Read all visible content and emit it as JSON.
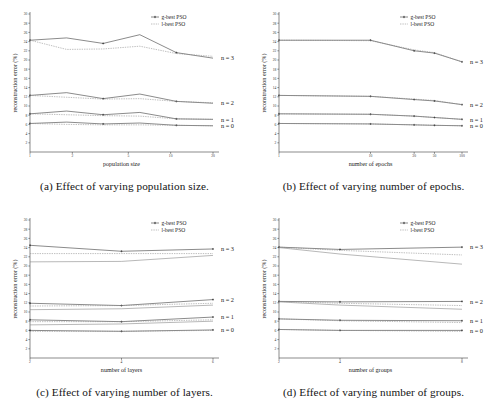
{
  "figure": {
    "background": "#ffffff",
    "series_colors": {
      "g_best": "#2b2b2b",
      "l_best": "#8a8a8a"
    }
  },
  "legend": {
    "g_best_label": "g-best PSO",
    "l_best_label": "l-best PSO"
  },
  "series_labels": {
    "n3": "n = 3",
    "n2": "n = 2",
    "n1": "n = 1",
    "n0": "n = 0"
  },
  "captions": {
    "a": "(a) Effect of varying population size.",
    "b": "(b) Effect of varying number of epochs.",
    "c": "(c) Effect of varying number of layers.",
    "d": "(d) Effect of varying number of groups."
  },
  "axis": {
    "ylabel": "reconstruction error (%)",
    "yticks": [
      "2",
      "4",
      "6",
      "8",
      "10",
      "12",
      "14",
      "16",
      "18",
      "20",
      "22",
      "24",
      "26",
      "28",
      "30"
    ]
  },
  "chart_data": [
    {
      "id": "a",
      "type": "line",
      "title": "(a) Effect of varying population size.",
      "xlabel": "population size",
      "ylabel": "reconstruction error (%)",
      "xscale": "log",
      "xticks": [
        "1",
        "2",
        "5",
        "10",
        "20"
      ],
      "x": [
        1,
        2,
        5,
        10,
        20
      ],
      "ylim": [
        0,
        30
      ],
      "xlim": [
        1,
        20
      ],
      "grid": false,
      "legend_position": "top-right",
      "series": [
        {
          "name": "g-best PSO n = 3",
          "style": "solid",
          "color": "#2b2b2b",
          "values": [
            24.3,
            24.8,
            23.6,
            25.5,
            21.6,
            20.4
          ]
        },
        {
          "name": "l-best PSO n = 3",
          "style": "dashed",
          "color": "#8a8a8a",
          "values": [
            24.3,
            22.3,
            22.4,
            23.0,
            21.4,
            20.8
          ]
        },
        {
          "name": "g-best PSO n = 2",
          "style": "solid",
          "color": "#2b2b2b",
          "values": [
            12.3,
            12.9,
            11.6,
            12.6,
            11.0,
            10.6
          ]
        },
        {
          "name": "l-best PSO n = 2",
          "style": "dashed",
          "color": "#8a8a8a",
          "values": [
            12.3,
            11.9,
            11.5,
            11.6,
            11.0,
            10.7
          ]
        },
        {
          "name": "g-best PSO n = 1",
          "style": "solid",
          "color": "#2b2b2b",
          "values": [
            8.3,
            8.9,
            8.1,
            8.6,
            7.2,
            7.1
          ]
        },
        {
          "name": "l-best PSO n = 1",
          "style": "dashed",
          "color": "#8a8a8a",
          "values": [
            8.3,
            8.1,
            7.9,
            7.8,
            7.2,
            7.1
          ]
        },
        {
          "name": "g-best PSO n = 0",
          "style": "solid",
          "color": "#2b2b2b",
          "values": [
            6.2,
            6.5,
            6.1,
            6.3,
            5.8,
            5.7
          ]
        },
        {
          "name": "l-best PSO n = 0",
          "style": "dashed",
          "color": "#8a8a8a",
          "values": [
            6.2,
            6.0,
            5.9,
            5.9,
            5.8,
            5.7
          ]
        }
      ]
    },
    {
      "id": "b",
      "type": "line",
      "title": "(b) Effect of varying number of epochs.",
      "xlabel": "number of epochs",
      "ylabel": "reconstruction error (%)",
      "xscale": "log",
      "xticks": [
        "1",
        "10",
        "30",
        "50",
        "100"
      ],
      "x": [
        1,
        10,
        30,
        50,
        100
      ],
      "ylim": [
        0,
        30
      ],
      "xlim": [
        1,
        100
      ],
      "grid": false,
      "legend_position": "top-right",
      "series": [
        {
          "name": "g-best PSO n = 3",
          "style": "solid",
          "color": "#2b2b2b",
          "values": [
            24.3,
            24.3,
            22.0,
            21.5,
            19.6
          ]
        },
        {
          "name": "l-best PSO n = 3",
          "style": "dashed",
          "color": "#8a8a8a",
          "values": [
            24.3,
            24.2,
            22.2,
            21.6,
            19.6
          ]
        },
        {
          "name": "g-best PSO n = 2",
          "style": "solid",
          "color": "#2b2b2b",
          "values": [
            12.3,
            12.1,
            11.4,
            11.1,
            10.3
          ]
        },
        {
          "name": "l-best PSO n = 2",
          "style": "dashed",
          "color": "#8a8a8a",
          "values": [
            12.3,
            12.1,
            11.5,
            11.2,
            10.3
          ]
        },
        {
          "name": "g-best PSO n = 1",
          "style": "solid",
          "color": "#2b2b2b",
          "values": [
            8.3,
            8.2,
            7.8,
            7.5,
            7.1
          ]
        },
        {
          "name": "l-best PSO n = 1",
          "style": "dashed",
          "color": "#8a8a8a",
          "values": [
            8.3,
            8.2,
            7.8,
            7.5,
            7.1
          ]
        },
        {
          "name": "g-best PSO n = 0",
          "style": "solid",
          "color": "#2b2b2b",
          "values": [
            6.2,
            6.1,
            5.9,
            5.8,
            5.7
          ]
        },
        {
          "name": "l-best PSO n = 0",
          "style": "dashed",
          "color": "#8a8a8a",
          "values": [
            6.2,
            6.1,
            5.9,
            5.8,
            5.7
          ]
        }
      ]
    },
    {
      "id": "c",
      "type": "line",
      "title": "(c) Effect of varying number of layers.",
      "xlabel": "number of layers",
      "ylabel": "reconstruction error (%)",
      "xscale": "linear",
      "xticks": [
        "2",
        "4",
        "6"
      ],
      "x": [
        2,
        4,
        6
      ],
      "ylim": [
        0,
        30
      ],
      "xlim": [
        2,
        6
      ],
      "grid": false,
      "legend_position": "top-right",
      "series": [
        {
          "name": "g-best PSO n = 3",
          "style": "solid",
          "color": "#2b2b2b",
          "values": [
            24.5,
            23.2,
            23.7
          ]
        },
        {
          "name": "l-best PSO n = 3",
          "style": "dashed",
          "color": "#8a8a8a",
          "values": [
            22.7,
            22.7,
            22.7
          ]
        },
        {
          "name": "l-best PSO n = 3 alt",
          "style": "solid",
          "color": "#9a9a9a",
          "values": [
            20.9,
            21.0,
            22.3
          ]
        },
        {
          "name": "g-best PSO n = 2",
          "style": "solid",
          "color": "#2b2b2b",
          "values": [
            11.9,
            11.4,
            12.7
          ]
        },
        {
          "name": "l-best PSO n = 2",
          "style": "dashed",
          "color": "#8a8a8a",
          "values": [
            11.3,
            11.4,
            11.9
          ]
        },
        {
          "name": "l-best PSO n = 2 alt",
          "style": "solid",
          "color": "#9a9a9a",
          "values": [
            10.5,
            10.7,
            11.5
          ]
        },
        {
          "name": "g-best PSO n = 1",
          "style": "solid",
          "color": "#2b2b2b",
          "values": [
            8.3,
            7.9,
            8.9
          ]
        },
        {
          "name": "l-best PSO n = 1",
          "style": "dashed",
          "color": "#8a8a8a",
          "values": [
            7.9,
            7.9,
            8.3
          ]
        },
        {
          "name": "l-best PSO n = 1 alt",
          "style": "solid",
          "color": "#9a9a9a",
          "values": [
            7.2,
            7.4,
            8.0
          ]
        },
        {
          "name": "g-best PSO n = 0",
          "style": "solid",
          "color": "#2b2b2b",
          "values": [
            6.0,
            5.8,
            6.1
          ]
        },
        {
          "name": "l-best PSO n = 0",
          "style": "dashed",
          "color": "#8a8a8a",
          "values": [
            5.8,
            5.8,
            6.0
          ]
        }
      ]
    },
    {
      "id": "d",
      "type": "line",
      "title": "(d) Effect of varying number of groups.",
      "xlabel": "number of groups",
      "ylabel": "reconstruction error (%)",
      "xscale": "linear",
      "xticks": [
        "2",
        "4",
        "8"
      ],
      "x": [
        2,
        4,
        8
      ],
      "ylim": [
        0,
        30
      ],
      "xlim": [
        2,
        8
      ],
      "grid": false,
      "legend_position": "top-right",
      "series": [
        {
          "name": "g-best PSO n = 3",
          "style": "solid",
          "color": "#2b2b2b",
          "values": [
            24.1,
            23.6,
            24.1
          ]
        },
        {
          "name": "l-best PSO n = 3",
          "style": "dashed",
          "color": "#8a8a8a",
          "values": [
            24.1,
            23.4,
            22.4
          ]
        },
        {
          "name": "l-best PSO n = 3 alt",
          "style": "solid",
          "color": "#9a9a9a",
          "values": [
            24.0,
            22.6,
            20.4
          ]
        },
        {
          "name": "g-best PSO n = 2",
          "style": "solid",
          "color": "#2b2b2b",
          "values": [
            12.3,
            12.2,
            12.3
          ]
        },
        {
          "name": "l-best PSO n = 2",
          "style": "dashed",
          "color": "#8a8a8a",
          "values": [
            12.3,
            11.9,
            11.4
          ]
        },
        {
          "name": "l-best PSO n = 2 alt",
          "style": "solid",
          "color": "#9a9a9a",
          "values": [
            12.2,
            11.5,
            10.6
          ]
        },
        {
          "name": "g-best PSO n = 1",
          "style": "solid",
          "color": "#2b2b2b",
          "values": [
            8.5,
            8.2,
            8.1
          ]
        },
        {
          "name": "l-best PSO n = 1",
          "style": "dashed",
          "color": "#8a8a8a",
          "values": [
            8.5,
            8.1,
            7.7
          ]
        },
        {
          "name": "g-best PSO n = 0",
          "style": "solid",
          "color": "#2b2b2b",
          "values": [
            6.2,
            6.0,
            6.0
          ]
        },
        {
          "name": "l-best PSO n = 0",
          "style": "dashed",
          "color": "#8a8a8a",
          "values": [
            6.2,
            6.0,
            5.8
          ]
        }
      ]
    }
  ]
}
